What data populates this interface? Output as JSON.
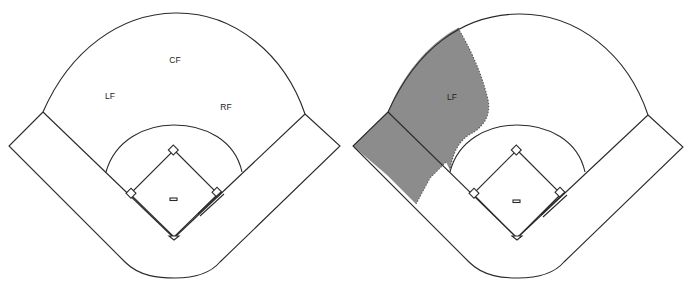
{
  "diagrams": [
    {
      "id": "field-all-positions",
      "labels": {
        "cf": "CF",
        "lf": "LF",
        "rf": "RF"
      },
      "highlight": null
    },
    {
      "id": "field-left-fielder-coverage",
      "labels": {
        "lf": "LF"
      },
      "highlight": {
        "position": "LF",
        "color": "#8c8c8c"
      }
    }
  ],
  "colors": {
    "line": "#2a2a2a",
    "background": "#ffffff",
    "shaded_area": "#8c8c8c"
  }
}
